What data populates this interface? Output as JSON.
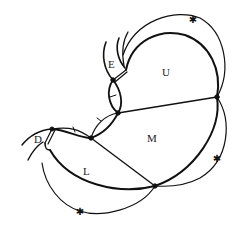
{
  "diagram": {
    "title": "",
    "regions": [
      {
        "id": "E",
        "label": "E",
        "x": 108,
        "y": 59
      },
      {
        "id": "U",
        "label": "U",
        "x": 162,
        "y": 67
      },
      {
        "id": "M",
        "label": "M",
        "x": 147,
        "y": 133
      },
      {
        "id": "L",
        "label": "L",
        "x": 83,
        "y": 166
      },
      {
        "id": "D",
        "label": "D",
        "x": 34,
        "y": 134
      }
    ],
    "markers": [
      {
        "type": "star",
        "x": 193,
        "y": 19
      },
      {
        "type": "star",
        "x": 217,
        "y": 158
      },
      {
        "type": "star",
        "x": 80,
        "y": 211
      }
    ],
    "colors": {
      "stroke": "#111111",
      "text": "#222222",
      "background": "#ffffff"
    }
  }
}
